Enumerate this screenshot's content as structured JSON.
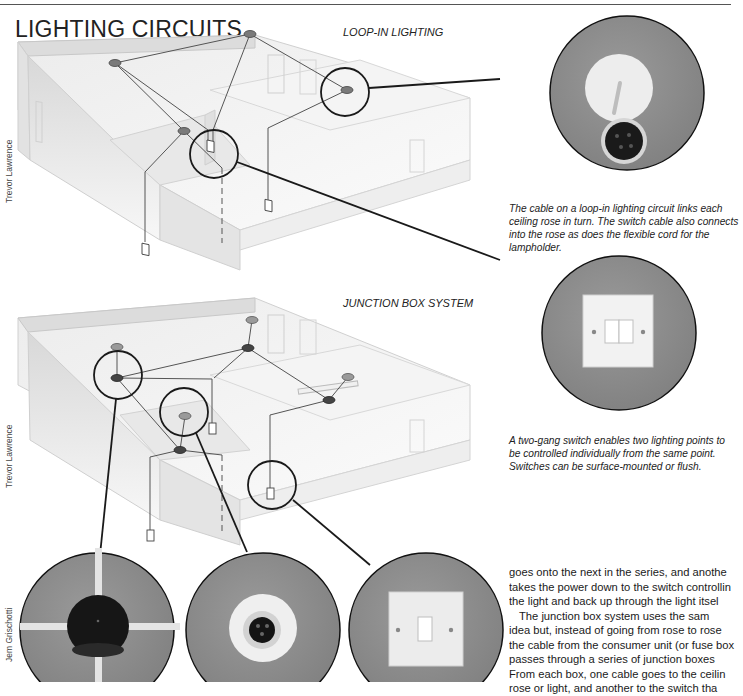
{
  "page": {
    "title": "LIGHTING CIRCUITS"
  },
  "sections": {
    "loop_in": {
      "label": "LOOP-IN LIGHTING",
      "credit": "Trevor Lawrence",
      "caption": "The cable on a loop-in lighting circuit links each ceiling rose in turn. The switch cable also connects into the rose as does the flexible cord for the lampholder.",
      "caption_lines": [
        "The cable on a loop-in lighting circuit links each",
        "ceiling rose in turn. The switch cable also connects",
        "into the rose as does the flexible cord for the",
        "lampholder."
      ],
      "inset": "ceiling-rose-photo"
    },
    "junction_box": {
      "label": "JUNCTION BOX SYSTEM",
      "credit": "Trevor Lawrence",
      "caption": "A two-gang switch enables two lighting points to be controlled individually from the same point. Switches can be surface-mounted or flush.",
      "caption_lines": [
        "A two-gang switch enables two lighting points to",
        "be controlled individually from the same point.",
        "Switches can be surface-mounted or flush."
      ],
      "inset": "two-gang-switch-photo"
    }
  },
  "bottom_insets": {
    "credit": "Jem Grischotti",
    "items": [
      "junction-box-photo",
      "batten-lampholder-photo",
      "one-gang-switch-photo"
    ]
  },
  "body_text": {
    "lines": [
      "goes onto the next in the series, and anothe",
      "takes the power down to the switch controllin",
      "the light and back up through the light itsel",
      "The junction box system uses the sam",
      "idea but, instead of going from rose to rose",
      "the cable from the consumer unit (or fuse box",
      "passes through a series of junction boxes",
      "From each box, one cable goes to the ceilin",
      "rose or light, and another to the switch tha"
    ]
  },
  "colors": {
    "ink": "#1a1a1a",
    "inset_grey": "#8c8c8c",
    "rose_fill": "#7a7a7a",
    "wall_shade": "#e6e6e6"
  }
}
